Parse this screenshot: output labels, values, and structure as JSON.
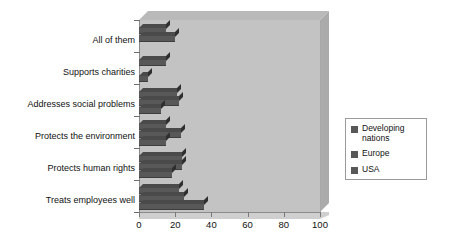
{
  "chart_data": {
    "type": "bar",
    "orientation": "horizontal",
    "title": "",
    "xlabel": "",
    "ylabel": "",
    "xlim": [
      0,
      100
    ],
    "xticks": [
      0,
      20,
      40,
      60,
      80,
      100
    ],
    "xticklabels": [
      "0",
      "20",
      "40",
      "60",
      "80",
      "100"
    ],
    "grid": false,
    "legend_position": "right",
    "categories": [
      "All of them",
      "Supports charities",
      "Addresses social problems",
      "Protects the environment",
      "Protects human rights",
      "Treats employees well"
    ],
    "series": [
      {
        "name": "Developing nations",
        "color": "#585858",
        "values": [
          15,
          15,
          21,
          15,
          24,
          22
        ]
      },
      {
        "name": "Europe",
        "color": "#585858",
        "values": [
          20,
          0,
          22,
          23,
          24,
          25
        ]
      },
      {
        "name": "USA",
        "color": "#585858",
        "values": [
          0,
          5,
          12,
          15,
          18,
          36
        ]
      }
    ]
  },
  "legend": {
    "items": [
      {
        "label": "Developing nations"
      },
      {
        "label": "Europe"
      },
      {
        "label": "USA"
      }
    ]
  },
  "colors": {
    "bar": "#585858",
    "plot_background": "#c3c3c3",
    "plot_top": "#b9b9b9",
    "plot_side": "#ababab",
    "axis": "#8a8a8a",
    "legend_border": "#9a9a9a",
    "text": "#111111",
    "page_background": "#ffffff"
  }
}
